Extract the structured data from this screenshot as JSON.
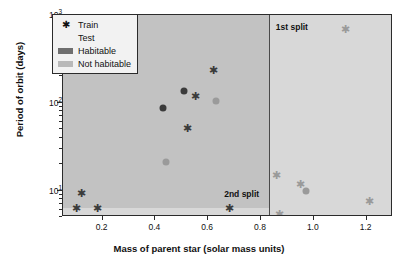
{
  "chart_data": {
    "type": "scatter",
    "title": "",
    "xlabel": "Mass of parent star (solar mass units)",
    "ylabel": "Period of orbit (days)",
    "yscale": "log",
    "xlim": [
      0.05,
      1.3
    ],
    "ylim": [
      5,
      1000
    ],
    "xticks": [
      0.2,
      0.4,
      0.6,
      0.8,
      1.0,
      1.2
    ],
    "xticklabels": [
      "0.2",
      "0.4",
      "0.6",
      "0.8",
      "1.0",
      "1.2"
    ],
    "yticks": [
      10,
      100,
      1000
    ],
    "yticklabels": [
      "10¹",
      "10²",
      "10³"
    ],
    "grid": false,
    "legend_position": "upper-left",
    "legend": [
      {
        "label": "Train",
        "marker": "star"
      },
      {
        "label": "Test",
        "marker": "circle"
      },
      {
        "label": "Habitable",
        "marker": "swatch-dark"
      },
      {
        "label": "Not habitable",
        "marker": "swatch-light"
      }
    ],
    "annotations": [
      {
        "text": "1st split",
        "x": 0.86,
        "y": 700,
        "kind": "split-label"
      },
      {
        "text": "2nd split",
        "x": 0.74,
        "y": 7.4,
        "kind": "split-label"
      }
    ],
    "decision_boundaries": [
      {
        "name": "1st split",
        "orientation": "vertical",
        "x": 0.83,
        "style": "solid"
      },
      {
        "name": "2nd split",
        "orientation": "horizontal",
        "y": 6.3,
        "style": "dashed"
      }
    ],
    "regions": [
      {
        "name": "habitable",
        "color": "#c2c2c2"
      },
      {
        "name": "not-habitable",
        "color": "#d8d8d8"
      }
    ],
    "series": [
      {
        "name": "Train / Habitable",
        "marker": "star",
        "color": "#3b3b3b",
        "points": [
          {
            "x": 0.62,
            "y": 235
          },
          {
            "x": 0.55,
            "y": 120
          },
          {
            "x": 0.52,
            "y": 52
          },
          {
            "x": 0.12,
            "y": 9.5
          },
          {
            "x": 0.1,
            "y": 6.3
          },
          {
            "x": 0.18,
            "y": 6.3
          },
          {
            "x": 0.68,
            "y": 6.3
          }
        ]
      },
      {
        "name": "Test / Habitable",
        "marker": "circle",
        "color": "#3b3b3b",
        "points": [
          {
            "x": 0.51,
            "y": 135
          },
          {
            "x": 0.43,
            "y": 88
          }
        ]
      },
      {
        "name": "Train / Not habitable",
        "marker": "star",
        "color": "#9a9a9a",
        "points": [
          {
            "x": 1.12,
            "y": 700
          },
          {
            "x": 0.86,
            "y": 15
          },
          {
            "x": 0.95,
            "y": 12
          },
          {
            "x": 1.21,
            "y": 7.6
          },
          {
            "x": 0.87,
            "y": 5.4
          }
        ]
      },
      {
        "name": "Test / Not habitable",
        "marker": "circle",
        "color": "#9a9a9a",
        "points": [
          {
            "x": 0.63,
            "y": 105
          },
          {
            "x": 0.44,
            "y": 21
          },
          {
            "x": 0.97,
            "y": 10
          }
        ]
      }
    ]
  },
  "axes": {
    "x_title": "Mass of parent star (solar mass units)",
    "y_title": "Period of orbit (days)"
  },
  "legend": {
    "train": "Train",
    "test": "Test",
    "habitable": "Habitable",
    "not_habitable": "Not habitable"
  },
  "splits": {
    "first": "1st split",
    "second": "2nd split"
  },
  "ticks": {
    "x": [
      "0.2",
      "0.4",
      "0.6",
      "0.8",
      "1.0",
      "1.2"
    ],
    "y": [
      "10",
      "10",
      "10"
    ],
    "y_exp": [
      "3",
      "2",
      "1"
    ]
  }
}
